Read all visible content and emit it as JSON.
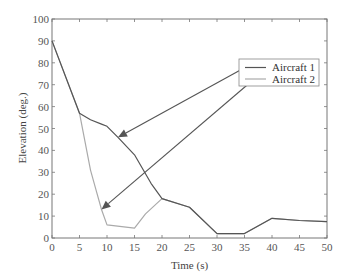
{
  "chart_data": {
    "type": "line",
    "title": "",
    "xlabel": "Time (s)",
    "ylabel": "Elevation (deg.)",
    "xlim": [
      0,
      50
    ],
    "ylim": [
      0,
      100
    ],
    "xticks": [
      0,
      5,
      10,
      15,
      20,
      25,
      30,
      35,
      40,
      45,
      50
    ],
    "yticks": [
      0,
      10,
      20,
      30,
      40,
      50,
      60,
      70,
      80,
      90,
      100
    ],
    "grid": false,
    "legend_position": "upper right (inside)",
    "series": [
      {
        "name": "Aircraft 1",
        "color": "#555555",
        "x": [
          0,
          5,
          7,
          9,
          10,
          12,
          15,
          18,
          20,
          25,
          30,
          35,
          40,
          45,
          50
        ],
        "y": [
          90,
          57,
          54,
          52,
          51,
          46,
          38,
          25,
          18,
          14,
          2,
          2,
          9,
          8,
          7.5
        ]
      },
      {
        "name": "Aircraft 2",
        "color": "#aaaaaa",
        "x": [
          0,
          5,
          7,
          8,
          9,
          10,
          15,
          17,
          20,
          25,
          30,
          35,
          40,
          45,
          50
        ],
        "y": [
          90,
          57,
          31,
          22,
          13,
          6,
          4.5,
          11,
          18,
          14,
          2,
          2,
          9,
          8,
          7.5
        ]
      }
    ],
    "annotations": [
      {
        "type": "arrow",
        "from_legend": "Aircraft 1",
        "points_to": {
          "x": 12,
          "y": 46
        }
      },
      {
        "type": "arrow",
        "from_legend": "Aircraft 2",
        "points_to": {
          "x": 9,
          "y": 13
        }
      }
    ]
  },
  "legend": {
    "items": [
      {
        "label": "Aircraft 1",
        "color": "#555555"
      },
      {
        "label": "Aircraft 2",
        "color": "#aaaaaa"
      }
    ]
  },
  "axes": {
    "xlabel": "Time (s)",
    "ylabel": "Elevation (deg.)"
  }
}
